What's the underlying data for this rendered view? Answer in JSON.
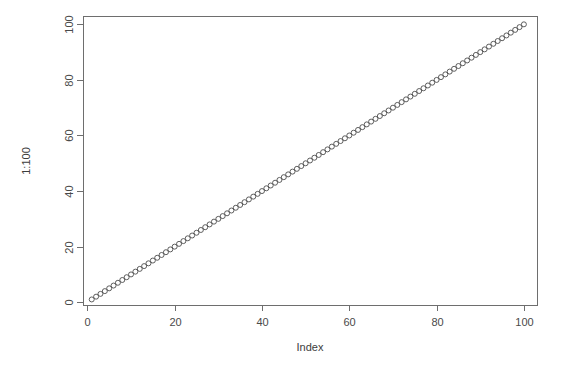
{
  "chart_data": {
    "type": "scatter",
    "title": "",
    "subtitle": "",
    "xlabel": "Index",
    "ylabel": "1:100",
    "xlim": [
      -1.0,
      103.0
    ],
    "ylim": [
      -1.0,
      103.0
    ],
    "grid": false,
    "legend": null,
    "legend_position": "none",
    "marker": "open-circle",
    "marker_size": 5,
    "point_color": "#4d4d4d",
    "axis_color": "#6e6e6e",
    "background_color": "#ffffff",
    "box_style": "full-box",
    "xticks": [
      0,
      20,
      40,
      60,
      80,
      100
    ],
    "xtick_labels": [
      "0",
      "20",
      "40",
      "60",
      "80",
      "100"
    ],
    "yticks": [
      0,
      20,
      40,
      60,
      80,
      100
    ],
    "ytick_labels": [
      "0",
      "20",
      "40",
      "60",
      "80",
      "100"
    ],
    "ytick_label_rotation": -90,
    "ylabel_rotation": -90,
    "series": [
      {
        "name": "1:100",
        "x": [
          1,
          2,
          3,
          4,
          5,
          6,
          7,
          8,
          9,
          10,
          11,
          12,
          13,
          14,
          15,
          16,
          17,
          18,
          19,
          20,
          21,
          22,
          23,
          24,
          25,
          26,
          27,
          28,
          29,
          30,
          31,
          32,
          33,
          34,
          35,
          36,
          37,
          38,
          39,
          40,
          41,
          42,
          43,
          44,
          45,
          46,
          47,
          48,
          49,
          50,
          51,
          52,
          53,
          54,
          55,
          56,
          57,
          58,
          59,
          60,
          61,
          62,
          63,
          64,
          65,
          66,
          67,
          68,
          69,
          70,
          71,
          72,
          73,
          74,
          75,
          76,
          77,
          78,
          79,
          80,
          81,
          82,
          83,
          84,
          85,
          86,
          87,
          88,
          89,
          90,
          91,
          92,
          93,
          94,
          95,
          96,
          97,
          98,
          99,
          100
        ],
        "values": [
          1,
          2,
          3,
          4,
          5,
          6,
          7,
          8,
          9,
          10,
          11,
          12,
          13,
          14,
          15,
          16,
          17,
          18,
          19,
          20,
          21,
          22,
          23,
          24,
          25,
          26,
          27,
          28,
          29,
          30,
          31,
          32,
          33,
          34,
          35,
          36,
          37,
          38,
          39,
          40,
          41,
          42,
          43,
          44,
          45,
          46,
          47,
          48,
          49,
          50,
          51,
          52,
          53,
          54,
          55,
          56,
          57,
          58,
          59,
          60,
          61,
          62,
          63,
          64,
          65,
          66,
          67,
          68,
          69,
          70,
          71,
          72,
          73,
          74,
          75,
          76,
          77,
          78,
          79,
          80,
          81,
          82,
          83,
          84,
          85,
          86,
          87,
          88,
          89,
          90,
          91,
          92,
          93,
          94,
          95,
          96,
          97,
          98,
          99,
          100
        ]
      }
    ],
    "n_points": 100
  },
  "plot_geometry": {
    "box_left": 83,
    "box_right": 537,
    "box_top": 16,
    "box_bottom": 305,
    "xlabel_x": 310,
    "xlabel_y": 351,
    "ylabel_x": 27,
    "ylabel_y": 161
  }
}
